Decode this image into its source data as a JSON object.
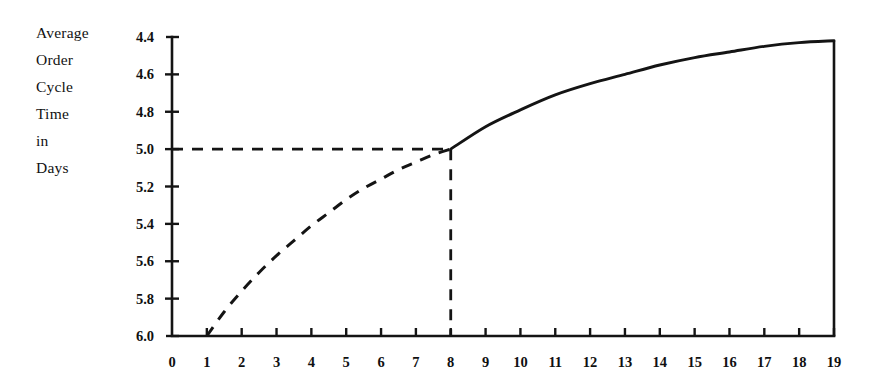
{
  "chart_data": {
    "type": "line",
    "title": "",
    "ylabel": "Average Order Cycle Time in Days",
    "ylabel_lines": [
      "Average",
      "Order",
      "Cycle",
      "Time",
      "in",
      "Days"
    ],
    "xlabel": "",
    "x_tick_labels": [
      "0",
      "1",
      "2",
      "3",
      "4",
      "5",
      "6",
      "7",
      "8",
      "9",
      "10",
      "11",
      "12",
      "13",
      "14",
      "15",
      "16",
      "17",
      "18",
      "19"
    ],
    "y_tick_labels": [
      "4.4",
      "4.6",
      "4.8",
      "5.0",
      "5.2",
      "5.4",
      "5.6",
      "5.8",
      "6.0"
    ],
    "xlim": [
      0,
      19
    ],
    "ylim": [
      6.0,
      4.4
    ],
    "y_axis_inverted": true,
    "grid": false,
    "legend": null,
    "series": [
      {
        "name": "projected-segment",
        "style": "dashed",
        "color": "#141414",
        "x": [
          1,
          1.5,
          2,
          2.5,
          3,
          3.5,
          4,
          4.5,
          5,
          5.5,
          6,
          6.5,
          7,
          7.5,
          8
        ],
        "values": [
          6.0,
          5.87,
          5.76,
          5.66,
          5.57,
          5.49,
          5.41,
          5.34,
          5.27,
          5.21,
          5.16,
          5.11,
          5.07,
          5.03,
          5.0
        ]
      },
      {
        "name": "observed-segment",
        "style": "solid",
        "color": "#141414",
        "x": [
          8,
          9,
          10,
          11,
          12,
          13,
          14,
          15,
          16,
          17,
          18,
          19
        ],
        "values": [
          5.0,
          4.88,
          4.79,
          4.71,
          4.65,
          4.6,
          4.55,
          4.51,
          4.48,
          4.45,
          4.43,
          4.42
        ]
      }
    ],
    "annotations": [
      {
        "name": "horizontal-guide-at-5.0",
        "style": "dashed",
        "from": {
          "x": 0,
          "y": 5.0
        },
        "to": {
          "x": 8,
          "y": 5.0
        }
      },
      {
        "name": "vertical-guide-at-8",
        "style": "dashed",
        "from": {
          "x": 8,
          "y": 5.0
        },
        "to": {
          "x": 8,
          "y": 6.0
        }
      },
      {
        "name": "vertical-drop-at-19",
        "style": "solid",
        "from": {
          "x": 19,
          "y": 4.42
        },
        "to": {
          "x": 19,
          "y": 6.0
        }
      }
    ]
  },
  "colors": {
    "ink": "#141414",
    "background": "#ffffff"
  }
}
